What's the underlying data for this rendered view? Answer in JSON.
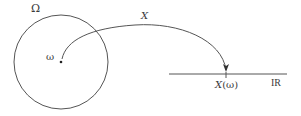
{
  "diagram": {
    "type": "random-variable-mapping",
    "colors": {
      "stroke": "#555555",
      "text": "#3a3a3a",
      "background": "#ffffff"
    },
    "sample_space": {
      "label": "Ω",
      "shape": "circle",
      "center": [
        61,
        62
      ],
      "radius": 47
    },
    "sample_point": {
      "label": "ω",
      "position": [
        61,
        62
      ]
    },
    "mapping": {
      "label": "X",
      "from": [
        62,
        59
      ],
      "to": [
        226,
        72
      ],
      "arrow": "end"
    },
    "real_line": {
      "label": "IR",
      "x_start": 169,
      "x_end": 287,
      "y": 74
    },
    "image_point": {
      "label_fn": "X",
      "label_arg": "(ω)",
      "label": "X(ω)",
      "tick_x": 226
    }
  }
}
